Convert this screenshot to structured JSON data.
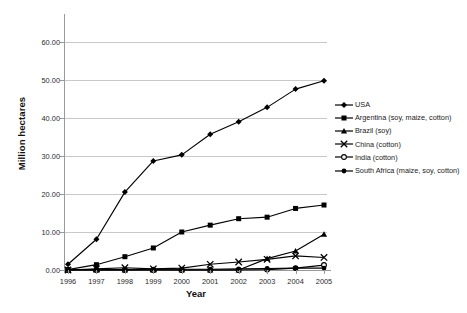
{
  "chart_data": {
    "type": "line",
    "title": "",
    "xlabel": "Year",
    "ylabel": "Million hectares",
    "x": [
      1996,
      1997,
      1998,
      1999,
      2000,
      2001,
      2002,
      2003,
      2004,
      2005
    ],
    "xtick_labels": [
      "1996",
      "1997",
      "1998",
      "1999",
      "2000",
      "2001",
      "2002",
      "2003",
      "2004",
      "2005"
    ],
    "ytick_labels": [
      "0.00",
      "10.00",
      "20.00",
      "30.00",
      "40.00",
      "50.00",
      "60.00"
    ],
    "ytick_values": [
      0,
      10,
      20,
      30,
      40,
      50,
      60
    ],
    "ylim": [
      0,
      65
    ],
    "xlim": [
      1996,
      2005
    ],
    "grid": "horizontal",
    "legend_position": "right",
    "series": [
      {
        "name": "USA",
        "marker": "diamond",
        "color": "#000000",
        "values": [
          1.5,
          8.1,
          20.5,
          28.7,
          30.3,
          35.7,
          39.0,
          42.8,
          47.6,
          49.8
        ]
      },
      {
        "name": "Argentina (soy, maize, cotton)",
        "marker": "square",
        "color": "#000000",
        "values": [
          0.1,
          1.4,
          3.5,
          5.8,
          10.0,
          11.8,
          13.5,
          13.9,
          16.2,
          17.1
        ]
      },
      {
        "name": "Brazil (soy)",
        "marker": "triangle",
        "color": "#000000",
        "values": [
          0.0,
          0.0,
          0.0,
          0.0,
          0.0,
          0.0,
          0.0,
          3.0,
          5.0,
          9.4
        ]
      },
      {
        "name": "China (cotton)",
        "marker": "cross",
        "color": "#000000",
        "values": [
          0.0,
          0.3,
          0.6,
          0.3,
          0.5,
          1.5,
          2.1,
          2.8,
          3.7,
          3.3
        ]
      },
      {
        "name": "India (cotton)",
        "marker": "circle-open",
        "color": "#000000",
        "values": [
          0.0,
          0.0,
          0.0,
          0.0,
          0.0,
          0.0,
          0.0,
          0.1,
          0.5,
          1.3
        ]
      },
      {
        "name": "South Africa (maize, soy, cotton)",
        "marker": "circle-filled",
        "color": "#000000",
        "values": [
          0.1,
          0.1,
          0.1,
          0.2,
          0.2,
          0.2,
          0.3,
          0.4,
          0.5,
          0.5
        ]
      }
    ]
  }
}
